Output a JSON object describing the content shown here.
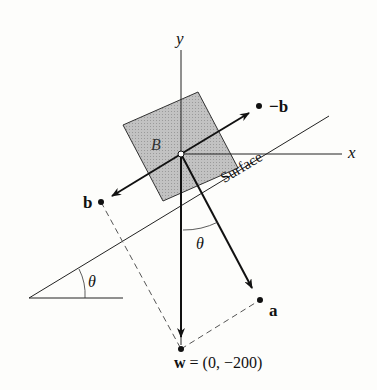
{
  "diagram": {
    "axes": {
      "x_label": "x",
      "y_label": "y"
    },
    "block_label": "B",
    "surface_label": "Surface",
    "angle_label": "θ",
    "vectors": {
      "neg_b": "−b",
      "b": "b",
      "a": "a",
      "w": "w",
      "w_value": "= (0, −200)"
    },
    "colors": {
      "ink": "#111111",
      "block_fill": "#b8b8b8",
      "dashed": "#555555"
    }
  }
}
